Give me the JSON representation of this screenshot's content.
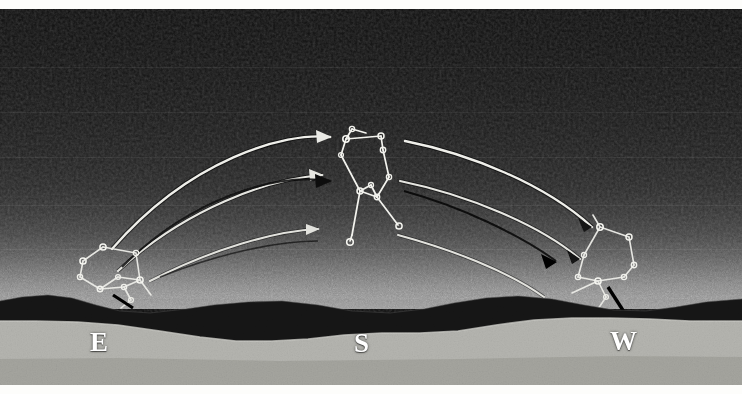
{
  "plate": {
    "title": "Diurnal path of Orion from rising in the east to setting in the west",
    "medium": "halftone astronomical plate",
    "background_color": "#0c0c0c",
    "ink_color": "#f2f2ee",
    "shadow_color": "#000000",
    "foreground_color": "#b3b3ae",
    "ridge_color": "#171717",
    "width": 742,
    "height": 394
  },
  "cardinal_labels": [
    {
      "id": "east",
      "text": "E",
      "x": 90,
      "y": 320
    },
    {
      "id": "south",
      "text": "S",
      "x": 354,
      "y": 321
    },
    {
      "id": "west",
      "text": "W",
      "x": 610,
      "y": 319
    }
  ],
  "meridian": {
    "label": "meridian-line",
    "x": 372,
    "y_top": 8,
    "y_bottom": 300,
    "color": "#e8e8e4"
  },
  "constellation_positions": [
    {
      "id": "orion-rising-east",
      "label": "Orion at rising, eastern horizon",
      "cx": 118,
      "cy": 268
    },
    {
      "id": "orion-meridian-south",
      "label": "Orion on the meridian, south",
      "cx": 370,
      "cy": 178
    },
    {
      "id": "orion-setting-west",
      "label": "Orion at setting, western horizon",
      "cx": 608,
      "cy": 258
    }
  ],
  "motion_arcs": [
    {
      "id": "arc-1",
      "label": "diurnal arc of Betelgeuse",
      "from": "E",
      "to": "W",
      "apex_y": 138,
      "arrowheads": 2,
      "style": "bright"
    },
    {
      "id": "arc-2",
      "label": "diurnal arc of Orion's belt",
      "from": "E",
      "to": "W",
      "apex_y": 172,
      "arrowheads": 2,
      "style": "bright"
    },
    {
      "id": "arc-3",
      "label": "diurnal arc of Rigel",
      "from": "E",
      "to": "W",
      "apex_y": 212,
      "arrowheads": 2,
      "style": "bright"
    },
    {
      "id": "arc-4",
      "label": "dark companion arc",
      "from": "E",
      "to": "W",
      "apex_y": 180,
      "arrowheads": 2,
      "style": "dark"
    }
  ],
  "stars": {
    "marker": "small open circle",
    "count_per_figure": 9,
    "names": [
      "Betelgeuse",
      "Bellatrix",
      "Alnitak",
      "Alnilam",
      "Mintaka",
      "Saiph",
      "Rigel",
      "Meissa",
      "Belt-knot"
    ]
  },
  "horizon": {
    "label": "undulating ridge silhouette",
    "mean_y": 296
  }
}
